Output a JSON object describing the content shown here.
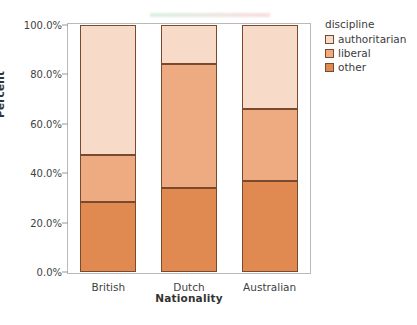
{
  "chart_data": {
    "type": "bar",
    "subtype": "stacked-percent",
    "title": "",
    "xlabel": "Nationality",
    "ylabel": "Percent",
    "categories": [
      "British",
      "Dutch",
      "Australian"
    ],
    "series": [
      {
        "name": "other",
        "values": [
          28.5,
          34.0,
          37.0
        ],
        "color": "#e08a52"
      },
      {
        "name": "liberal",
        "values": [
          18.8,
          50.3,
          29.0
        ],
        "color": "#eeaa80"
      },
      {
        "name": "authoritarian",
        "values": [
          52.7,
          15.7,
          34.0
        ],
        "color": "#f7dbc8"
      }
    ],
    "cumulative_boundaries": {
      "British": {
        "other_top": 28.5,
        "liberal_top": 47.3,
        "authoritarian_top": 100.0
      },
      "Dutch": {
        "other_top": 34.0,
        "liberal_top": 84.3,
        "authoritarian_top": 100.0
      },
      "Australian": {
        "other_top": 37.0,
        "liberal_top": 66.0,
        "authoritarian_top": 100.0
      }
    },
    "ylim": [
      0,
      100
    ],
    "ytick_values": [
      0,
      20,
      40,
      60,
      80,
      100
    ],
    "ytick_labels": [
      "0.0%",
      "20.0%",
      "40.0%",
      "60.0%",
      "80.0%",
      "100.0%"
    ],
    "grid": false,
    "legend_position": "right",
    "legend_title": "discipline",
    "legend_entries": [
      "authoritarian",
      "liberal",
      "other"
    ]
  },
  "axes": {
    "y_title": "Percent",
    "x_title": "Nationality",
    "y_ticks": [
      {
        "label": "100.0%",
        "value": 100
      },
      {
        "label": "80.0%",
        "value": 80
      },
      {
        "label": "60.0%",
        "value": 60
      },
      {
        "label": "40.0%",
        "value": 40
      },
      {
        "label": "20.0%",
        "value": 20
      },
      {
        "label": "0.0%",
        "value": 0
      }
    ],
    "x_ticks": [
      "British",
      "Dutch",
      "Australian"
    ]
  },
  "legend": {
    "title": "discipline",
    "items": [
      {
        "label": "authoritarian",
        "color": "#f7dbc8"
      },
      {
        "label": "liberal",
        "color": "#eeaa80"
      },
      {
        "label": "other",
        "color": "#e08a52"
      }
    ]
  },
  "colors": {
    "authoritarian": "#f7dbc8",
    "liberal": "#eeaa80",
    "other": "#e08a52",
    "segment_border": "#7a4a2e",
    "frame": "#b9b9b9",
    "text": "#3b3b3b"
  }
}
